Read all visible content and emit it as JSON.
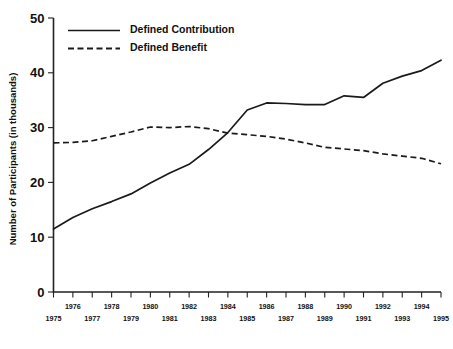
{
  "chart_data": {
    "type": "line",
    "title": "",
    "xlabel": "",
    "ylabel": "Number of Participants (in thousands)",
    "xlim": [
      1975,
      1995
    ],
    "ylim": [
      0,
      50
    ],
    "grid": false,
    "legend_position": "top-left",
    "x": [
      1975,
      1976,
      1977,
      1978,
      1979,
      1980,
      1981,
      1982,
      1983,
      1984,
      1985,
      1986,
      1987,
      1988,
      1989,
      1990,
      1991,
      1992,
      1993,
      1994,
      1995
    ],
    "categories": [
      "1975",
      "1976",
      "1977",
      "1978",
      "1979",
      "1980",
      "1981",
      "1982",
      "1983",
      "1984",
      "1985",
      "1986",
      "1987",
      "1988",
      "1989",
      "1990",
      "1991",
      "1992",
      "1993",
      "1994",
      "1995"
    ],
    "yticks": [
      0,
      10,
      20,
      30,
      40,
      50
    ],
    "ytick_labels": [
      "0",
      "10",
      "20",
      "30",
      "40",
      "50"
    ],
    "xticks_upper": [
      "1976",
      "1978",
      "1980",
      "1982",
      "1984",
      "1986",
      "1988",
      "1990",
      "1992",
      "1994"
    ],
    "xticks_lower": [
      "1975",
      "1977",
      "1979",
      "1981",
      "1983",
      "1985",
      "1987",
      "1989",
      "1991",
      "1993",
      "1995"
    ],
    "series": [
      {
        "name": "Defined Contribution",
        "style": "solid",
        "color": "#1a1a1a",
        "values": [
          11.5,
          13.6,
          15.2,
          16.5,
          17.9,
          19.9,
          21.7,
          23.3,
          26.0,
          29.1,
          33.2,
          34.5,
          34.4,
          34.2,
          34.2,
          35.8,
          35.5,
          38.1,
          39.4,
          40.4,
          42.3
        ]
      },
      {
        "name": "Defined Benefit",
        "style": "dashed",
        "color": "#1a1a1a",
        "values": [
          27.2,
          27.3,
          27.6,
          28.4,
          29.2,
          30.1,
          30.0,
          30.2,
          29.8,
          29.0,
          28.7,
          28.4,
          27.9,
          27.2,
          26.4,
          26.1,
          25.8,
          25.2,
          24.8,
          24.4,
          23.4
        ]
      }
    ],
    "legend": [
      {
        "label": "Defined Contribution",
        "style": "solid"
      },
      {
        "label": "Defined Benefit",
        "style": "dashed"
      }
    ]
  }
}
